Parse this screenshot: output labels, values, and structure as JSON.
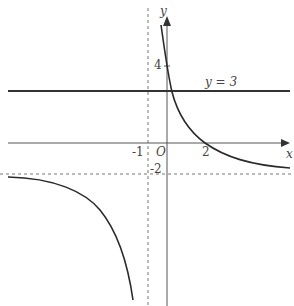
{
  "graph": {
    "function": "y = 6/(x+1) - 2",
    "axes": {
      "x_label": "x",
      "y_label": "y",
      "origin_label": "O"
    },
    "ticks": {
      "x": [
        "-1",
        "2"
      ],
      "y": [
        "4",
        "-2"
      ]
    },
    "lines": [
      {
        "name": "y=3",
        "label": "y = 3",
        "style": "solid"
      },
      {
        "name": "vertical-asymptote",
        "equation": "x = -1",
        "style": "dashed"
      },
      {
        "name": "horizontal-asymptote",
        "equation": "y = -2",
        "style": "dashed"
      }
    ],
    "colors": {
      "curve": "#2a2a2a",
      "axis": "#555555",
      "dashed": "#666666",
      "line": "#333333"
    }
  }
}
